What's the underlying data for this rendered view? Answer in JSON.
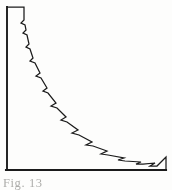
{
  "figure": {
    "caption": "Fig. 13",
    "caption_visible_fragment": "Fig. 13",
    "background_color": "#fdfdfc",
    "ink_color": "#1b1b1b"
  },
  "chart_data": {
    "type": "line",
    "title": "",
    "xlabel": "",
    "ylabel": "",
    "grid": false,
    "legend": null,
    "annotations": [],
    "axis_lines": {
      "vertical_axis": {
        "x": 7,
        "y_top": 7,
        "y_bottom": 170
      },
      "horizontal_axis": {
        "y": 170,
        "x_left": 7,
        "x_right": 166
      },
      "right_closure": {
        "x": 166,
        "y_top": 157,
        "y_bottom": 170
      }
    },
    "xlim": [
      0,
      172
    ],
    "ylim": [
      0,
      190
    ],
    "series": [
      {
        "name": "decay-curve",
        "points": [
          [
            7,
            7
          ],
          [
            24,
            7
          ],
          [
            24,
            20
          ],
          [
            21,
            23
          ],
          [
            25,
            25
          ],
          [
            26,
            30
          ],
          [
            23,
            33
          ],
          [
            27,
            35
          ],
          [
            29,
            44
          ],
          [
            26,
            47
          ],
          [
            30,
            49
          ],
          [
            33,
            58
          ],
          [
            30,
            61
          ],
          [
            35,
            63
          ],
          [
            40,
            73
          ],
          [
            36,
            76
          ],
          [
            41,
            78
          ],
          [
            47,
            88
          ],
          [
            43,
            91
          ],
          [
            48,
            93
          ],
          [
            56,
            103
          ],
          [
            51,
            106
          ],
          [
            57,
            108
          ],
          [
            66,
            117
          ],
          [
            61,
            120
          ],
          [
            67,
            122
          ],
          [
            78,
            130
          ],
          [
            72,
            133
          ],
          [
            79,
            135
          ],
          [
            92,
            142
          ],
          [
            86,
            145
          ],
          [
            93,
            146
          ],
          [
            107,
            151
          ],
          [
            101,
            154
          ],
          [
            108,
            155
          ],
          [
            124,
            158
          ],
          [
            118,
            160
          ],
          [
            125,
            161
          ],
          [
            141,
            162
          ],
          [
            136,
            164
          ],
          [
            143,
            164
          ],
          [
            155,
            163
          ],
          [
            150,
            166
          ],
          [
            157,
            166
          ],
          [
            166,
            157
          ],
          [
            166,
            170
          ]
        ]
      }
    ]
  }
}
